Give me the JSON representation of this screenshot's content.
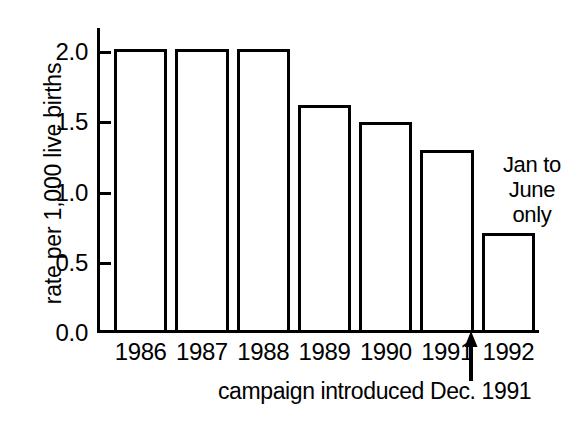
{
  "chart_data": {
    "type": "bar",
    "title": "",
    "xlabel": "",
    "ylabel": "rate per 1,000 live births",
    "categories": [
      "1986",
      "1987",
      "1988",
      "1989",
      "1990",
      "1991",
      "1992"
    ],
    "values": [
      2.0,
      2.0,
      2.0,
      1.6,
      1.48,
      1.28,
      0.69
    ],
    "ylim": [
      0.0,
      2.15
    ],
    "yticks": [
      "0.0",
      "0.5",
      "1.0",
      "1.5",
      "2.0"
    ],
    "ytick_values": [
      0.0,
      0.5,
      1.0,
      1.5,
      2.0
    ],
    "grid": false,
    "legend": "none",
    "bar_fill_color": "#ffffff",
    "bar_edge_color": "#000000",
    "annotations": [
      {
        "name": "jan-to-june-only",
        "lines": [
          "Jan to",
          "June",
          "only"
        ],
        "target_category": "1992"
      },
      {
        "name": "campaign-introduced",
        "text": "campaign introduced Dec. 1991",
        "marker": "up-arrow",
        "target_position": "between 1991 and 1992"
      }
    ]
  }
}
